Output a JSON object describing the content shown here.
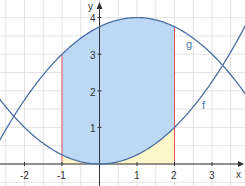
{
  "chart_data": {
    "type": "area",
    "title": "",
    "xlabel": "x",
    "ylabel": "y",
    "xlim": [
      -2.65,
      3.85
    ],
    "ylim": [
      -0.6,
      4.5
    ],
    "grid": true,
    "x_ticks": [
      "-2",
      "-1",
      "1",
      "2",
      "3"
    ],
    "y_ticks": [
      "1",
      "2",
      "3",
      "4"
    ],
    "series": [
      {
        "name": "f",
        "formula": "x^2/4",
        "color": "#4a6fa5",
        "x": [
          -2.65,
          -2,
          -1,
          0,
          1,
          2,
          3,
          3.85
        ],
        "values": [
          1.76,
          1.0,
          0.25,
          0.0,
          0.25,
          1.0,
          2.25,
          3.7
        ]
      },
      {
        "name": "g",
        "formula": "4-(x-1)^2/4",
        "color": "#4a6fa5",
        "x": [
          -2.65,
          -2,
          -1,
          0,
          1,
          2,
          3,
          3.85
        ],
        "values": [
          0.67,
          1.75,
          3.0,
          3.75,
          4.0,
          3.75,
          3.0,
          1.97
        ]
      }
    ],
    "shaded_regions": [
      {
        "name": "between f and g",
        "from": -1,
        "to": 2,
        "color": "#bcd8f5"
      },
      {
        "name": "under f",
        "from": -1,
        "to": 2,
        "color": "#fdf6c8"
      }
    ],
    "boundary_lines": [
      {
        "x": -1,
        "color": "#e05050"
      },
      {
        "x": 2,
        "color": "#e05050"
      }
    ],
    "intersections": [
      {
        "x": -2.28,
        "y": 1.3
      },
      {
        "x": 3.28,
        "y": 2.7
      }
    ],
    "annotations": [
      {
        "text": "g",
        "x": 2.55,
        "y": 3.4
      },
      {
        "text": "f",
        "x": 2.8,
        "y": 1.5
      }
    ]
  },
  "labels": {
    "x_axis": "x",
    "y_axis": "y",
    "curve_f": "f",
    "curve_g": "g",
    "xt": [
      "-2",
      "-1",
      "1",
      "2",
      "3"
    ],
    "yt": [
      "1",
      "2",
      "3",
      "4"
    ]
  }
}
